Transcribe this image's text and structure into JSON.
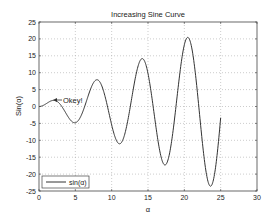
{
  "chart_data": {
    "type": "line",
    "title": "Increasing Sine Curve",
    "xlabel": "α",
    "ylabel": "Sin(α)",
    "xlim": [
      0,
      30
    ],
    "ylim": [
      -25,
      25
    ],
    "xticks": [
      0,
      5,
      10,
      15,
      20,
      25,
      30
    ],
    "yticks": [
      -25,
      -20,
      -15,
      -10,
      -5,
      0,
      5,
      10,
      15,
      20,
      25
    ],
    "grid": true,
    "legend": {
      "position": "lower-left",
      "entries": [
        "sin(α)"
      ]
    },
    "annotations": [
      {
        "text": "Okey!",
        "arrow_to": {
          "x": 2.0,
          "y": 1.8
        }
      }
    ],
    "series": [
      {
        "name": "sin(α)",
        "formula": "x*sin(x)",
        "x_range": [
          0,
          25
        ],
        "key_points": [
          {
            "x": 0,
            "y": 0
          },
          {
            "x": 2.0,
            "y": 1.8
          },
          {
            "x": 4.9,
            "y": -4.8
          },
          {
            "x": 7.98,
            "y": 7.9
          },
          {
            "x": 11.09,
            "y": -11.0
          },
          {
            "x": 14.2,
            "y": 14.1
          },
          {
            "x": 17.3,
            "y": -17.3
          },
          {
            "x": 20.4,
            "y": 20.4
          },
          {
            "x": 23.6,
            "y": -23.5
          },
          {
            "x": 25.0,
            "y": -3.3
          }
        ]
      }
    ]
  },
  "labels": {
    "title": "Increasing Sine Curve",
    "xlabel": "α",
    "ylabel": "Sin(α)",
    "legend_entry": "sin(α)",
    "annotation": "Okey!"
  },
  "colors": {
    "line": "#333333",
    "axes": "#333333",
    "grid": "#aaaaaa",
    "background": "#ffffff"
  }
}
